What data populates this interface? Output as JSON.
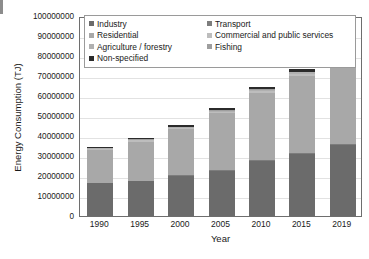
{
  "chart_data": {
    "type": "bar",
    "stacked": true,
    "title": "",
    "xlabel": "Year",
    "ylabel": "Energy Consumption (TJ)",
    "categories": [
      "1990",
      "1995",
      "2000",
      "2005",
      "2010",
      "2015",
      "2019"
    ],
    "ylim": [
      0,
      100000000
    ],
    "ytick_values": [
      0,
      10000000,
      20000000,
      30000000,
      40000000,
      50000000,
      60000000,
      70000000,
      80000000,
      90000000,
      100000000
    ],
    "ytick_labels": [
      "0",
      "10000000",
      "20000000",
      "30000000",
      "40000000",
      "50000000",
      "60000000",
      "70000000",
      "80000000",
      "90000000",
      "100000000"
    ],
    "grid": true,
    "legend_position": "top-inside",
    "series": [
      {
        "name": "Industry",
        "color": "#6b6b6b",
        "values": [
          16500000,
          17500000,
          20000000,
          22500000,
          27500000,
          31000000,
          35500000
        ]
      },
      {
        "name": "Transport",
        "color": "#7d7d7d",
        "values": [
          250000,
          250000,
          300000,
          350000,
          400000,
          450000,
          500000
        ]
      },
      {
        "name": "Residential",
        "color": "#a8a8a8",
        "values": [
          16500000,
          19500000,
          23000000,
          28500000,
          33500000,
          38500000,
          42500000
        ]
      },
      {
        "name": "Commercial and public services",
        "color": "#bdbdbd",
        "values": [
          500000,
          600000,
          700000,
          900000,
          1100000,
          1300000,
          1500000
        ]
      },
      {
        "name": "Agriculture / forestry",
        "color": "#b0b0b0",
        "values": [
          300000,
          350000,
          400000,
          500000,
          600000,
          700000,
          800000
        ]
      },
      {
        "name": "Fishing",
        "color": "#9e9e9e",
        "values": [
          150000,
          150000,
          200000,
          200000,
          250000,
          250000,
          300000
        ]
      },
      {
        "name": "Non-specified",
        "color": "#2b2b2b",
        "values": [
          300000,
          700000,
          900000,
          1300000,
          1400000,
          1300000,
          1400000
        ]
      }
    ]
  },
  "legend": {
    "rows": [
      [
        {
          "label": "Industry",
          "color": "#6b6b6b"
        },
        {
          "label": "Transport",
          "color": "#7d7d7d"
        }
      ],
      [
        {
          "label": "Residential",
          "color": "#a8a8a8"
        },
        {
          "label": "Commercial and public services",
          "color": "#bdbdbd"
        }
      ],
      [
        {
          "label": "Agriculture / forestry",
          "color": "#b0b0b0"
        },
        {
          "label": "Fishing",
          "color": "#9e9e9e"
        }
      ],
      [
        {
          "label": "Non-specified",
          "color": "#2b2b2b"
        }
      ]
    ]
  }
}
